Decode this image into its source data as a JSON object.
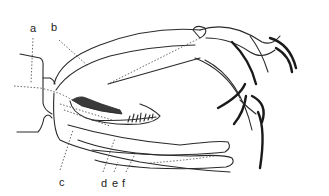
{
  "figure": {
    "type": "anatomical line drawing",
    "labels": [
      {
        "id": "a",
        "text": "a",
        "x": 30,
        "y": 23
      },
      {
        "id": "b",
        "text": "b",
        "x": 51,
        "y": 22
      },
      {
        "id": "c",
        "text": "c",
        "x": 59,
        "y": 177
      },
      {
        "id": "d",
        "text": "d",
        "x": 101,
        "y": 178
      },
      {
        "id": "e",
        "text": "e",
        "x": 112,
        "y": 178
      },
      {
        "id": "f",
        "text": "f",
        "x": 122,
        "y": 178
      }
    ],
    "colors": {
      "line": "#2a2a2a",
      "background": "#ffffff"
    }
  }
}
